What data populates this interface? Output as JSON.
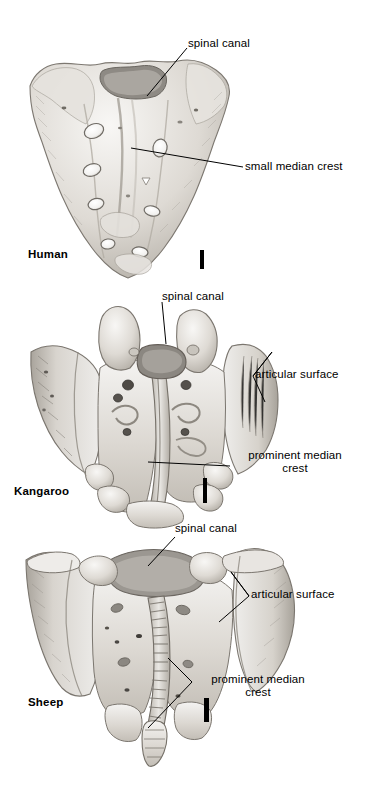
{
  "figure": {
    "kind": "anatomical-plate",
    "background_color": "#ffffff",
    "ink_color": "#000000",
    "bone_light": "#f2f1ef",
    "bone_mid": "#cfccc7",
    "bone_shadow": "#9a968f"
  },
  "panels": [
    {
      "id": "human",
      "specimen_label": "Human",
      "scalebar": {
        "present": true
      },
      "annotations": [
        {
          "id": "human-spinal-canal",
          "text": "spinal canal"
        },
        {
          "id": "human-small-median-crest",
          "text": "small median crest"
        }
      ]
    },
    {
      "id": "kangaroo",
      "specimen_label": "Kangaroo",
      "scalebar": {
        "present": true
      },
      "annotations": [
        {
          "id": "kangaroo-spinal-canal",
          "text": "spinal canal"
        },
        {
          "id": "kangaroo-articular-surface",
          "text": "articular surface"
        },
        {
          "id": "kangaroo-prominent-median-crest",
          "text": "prominent median\ncrest"
        }
      ]
    },
    {
      "id": "sheep",
      "specimen_label": "Sheep",
      "scalebar": {
        "present": true
      },
      "annotations": [
        {
          "id": "sheep-spinal-canal",
          "text": "spinal canal"
        },
        {
          "id": "sheep-articular-surface",
          "text": "articular surface"
        },
        {
          "id": "sheep-prominent-median-crest",
          "text": "prominent median\ncrest"
        }
      ]
    }
  ]
}
